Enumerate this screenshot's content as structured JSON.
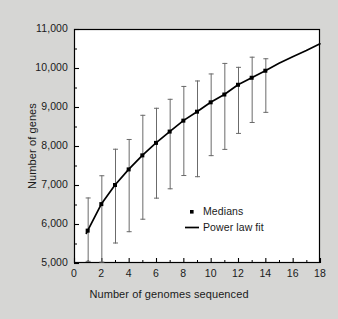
{
  "chart_data": {
    "type": "line",
    "title": "",
    "xlabel": "Number of genomes sequenced",
    "ylabel": "Number of genes",
    "xlim": [
      0,
      18
    ],
    "ylim": [
      5000,
      11000
    ],
    "xticks": [
      0,
      2,
      4,
      6,
      8,
      10,
      12,
      14,
      16,
      18
    ],
    "xtick_labels": [
      "0",
      "2",
      "4",
      "6",
      "8",
      "10",
      "12",
      "14",
      "16",
      "18"
    ],
    "yticks": [
      5000,
      6000,
      7000,
      8000,
      9000,
      10000,
      11000
    ],
    "ytick_labels": [
      "5,000",
      "6,000",
      "7,000",
      "8,000",
      "9,000",
      "10,000",
      "11,000"
    ],
    "minor_ticks": true,
    "grid": false,
    "legend_position": "center-right",
    "legend": [
      {
        "label": "Medians",
        "marker": "square",
        "color": "#000000"
      },
      {
        "label": "Power law fit",
        "marker": "line",
        "color": "#000000"
      }
    ],
    "series": [
      {
        "name": "Medians",
        "marker": "square",
        "color": "#000000",
        "x": [
          1,
          2,
          3,
          4,
          5,
          6,
          7,
          8,
          9,
          10,
          11,
          12,
          13,
          14
        ],
        "values": [
          5830,
          6510,
          7000,
          7400,
          7760,
          8080,
          8370,
          8650,
          8880,
          9120,
          9320,
          9570,
          9750,
          9930
        ],
        "error_low": [
          5030,
          5010,
          5500,
          5790,
          6110,
          6650,
          6890,
          7230,
          7200,
          7740,
          7900,
          8310,
          8590,
          8850
        ],
        "error_high": [
          6680,
          7250,
          7930,
          8180,
          8800,
          8980,
          9210,
          9540,
          9680,
          9860,
          10130,
          10030,
          10290,
          10250
        ]
      },
      {
        "name": "Power law fit",
        "marker": "line",
        "color": "#000000",
        "x": [
          0.9,
          1,
          2,
          3,
          4,
          5,
          6,
          7,
          8,
          9,
          10,
          11,
          12,
          13,
          14,
          15,
          16,
          17,
          18
        ],
        "values": [
          5760,
          5830,
          6510,
          7000,
          7400,
          7760,
          8080,
          8370,
          8650,
          8880,
          9120,
          9320,
          9570,
          9750,
          9930,
          10120,
          10290,
          10450,
          10620
        ]
      }
    ]
  },
  "axes": {
    "frame_color": "#000000",
    "background_color": "#ffffff",
    "figure_background": "#d6d6d4"
  }
}
